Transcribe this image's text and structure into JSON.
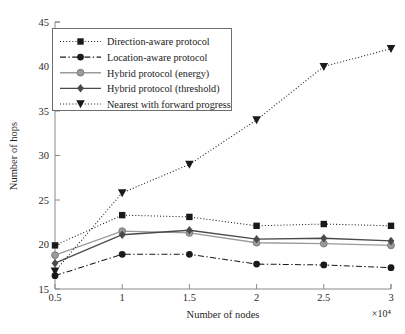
{
  "chart_data": {
    "type": "line",
    "title": "",
    "xlabel": "Number of nodes",
    "ylabel": "Number of hops",
    "x_multiplier": "×10⁴",
    "x": [
      0.5,
      1,
      1.5,
      2,
      2.5,
      3
    ],
    "xtick_labels": [
      "0.5",
      "1",
      "1.5",
      "2",
      "2.5",
      "3"
    ],
    "ytick_labels": [
      "15",
      "20",
      "25",
      "30",
      "35",
      "40",
      "45"
    ],
    "ytick_values": [
      15,
      20,
      25,
      30,
      35,
      40,
      45
    ],
    "xlim": [
      0.5,
      3
    ],
    "ylim": [
      15,
      45
    ],
    "grid": false,
    "legend_position": "upper-left",
    "series": [
      {
        "name": "Direction-aware protocol",
        "values": [
          19.9,
          23.3,
          23.1,
          22.1,
          22.3,
          22.1
        ],
        "marker": "square",
        "line_style": "dotted",
        "color": "#1a1a1a"
      },
      {
        "name": "Location-aware protocol",
        "values": [
          16.5,
          18.9,
          18.9,
          17.8,
          17.7,
          17.4
        ],
        "marker": "circle",
        "line_style": "dash-dot",
        "color": "#1a1a1a"
      },
      {
        "name": "Hybrid protocol (energy)",
        "values": [
          18.8,
          21.5,
          21.3,
          20.2,
          20.1,
          19.9
        ],
        "marker": "circle",
        "line_style": "solid",
        "color": "#9a9a9a"
      },
      {
        "name": "Hybrid protocol (threshold)",
        "values": [
          17.9,
          21.1,
          21.6,
          20.6,
          20.7,
          20.4
        ],
        "marker": "diamond",
        "line_style": "solid",
        "color": "#4a4a4a"
      },
      {
        "name": "Nearest with forward progress",
        "values": [
          17.0,
          25.8,
          29.0,
          34.0,
          40.0,
          42.0
        ],
        "marker": "triangle-down",
        "line_style": "dotted",
        "color": "#1a1a1a"
      }
    ]
  },
  "legend": {
    "items": [
      "Direction-aware protocol",
      "Location-aware protocol",
      "Hybrid protocol (energy)",
      "Hybrid protocol (threshold)",
      "Nearest with forward progress"
    ]
  },
  "axes": {
    "x_title": "Number of nodes",
    "y_title": "Number of hops",
    "x_exponent": "×10⁴"
  }
}
